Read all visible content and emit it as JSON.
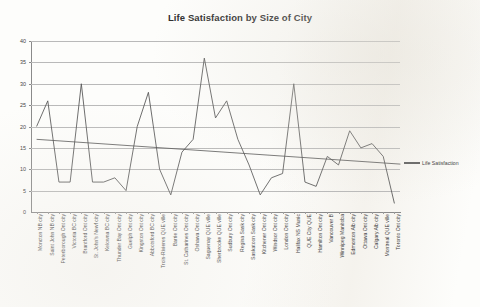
{
  "chart_data": {
    "type": "line",
    "title": "Life Satisfaction by Size of City",
    "xlabel": "",
    "ylabel": "",
    "ylim": [
      0,
      40
    ],
    "yticks": [
      0,
      5,
      10,
      15,
      20,
      25,
      30,
      35,
      40
    ],
    "grid": true,
    "legend_position": "right",
    "legend": [
      "Life Satisfaction"
    ],
    "categories": [
      "Moncton NB city",
      "Saint John NB city",
      "Peterborough Ont city",
      "Victoria BC city",
      "Brantford Ont city",
      "St. John's Newf city",
      "Kelowna BC city",
      "Thunder Bay Ont city",
      "Guelph Ont city",
      "Kingston Ont city",
      "Abbotsford BC city",
      "Trois-Rivieres QUE ville",
      "Barrie Ont city",
      "St. Catharines Ont city",
      "Oshawa Ont city",
      "Saguenay QUE ville",
      "Sherbrooke QUE ville",
      "Sudbury Ont city",
      "Regina Sask city",
      "Saskatoon Sask city",
      "Kitchener Ont city",
      "Windsor Ont city",
      "London Ont city",
      "Halifax NS Munic",
      "QUE City QUE",
      "Hamilton Ont city",
      "Vancouver B",
      "Winnipeg Manitoba",
      "Edmonton Alb city",
      "Ottawa Ont city",
      "Calgary Alb city",
      "Montreal QUE ville",
      "Toronto Ont city"
    ],
    "series": [
      {
        "name": "Life Satisfaction",
        "values": [
          20,
          26,
          7,
          7,
          30,
          7,
          7,
          8,
          5,
          20,
          28,
          10,
          4,
          14,
          17,
          36,
          22,
          26,
          17,
          11,
          4,
          8,
          9,
          30,
          7,
          6,
          13,
          11,
          19,
          15,
          16,
          13,
          2
        ]
      }
    ],
    "trendline": {
      "name": "Linear trend",
      "start_value": 17.0,
      "end_value": 11.2
    }
  },
  "legend": {
    "label": "Life Satisfaction"
  }
}
